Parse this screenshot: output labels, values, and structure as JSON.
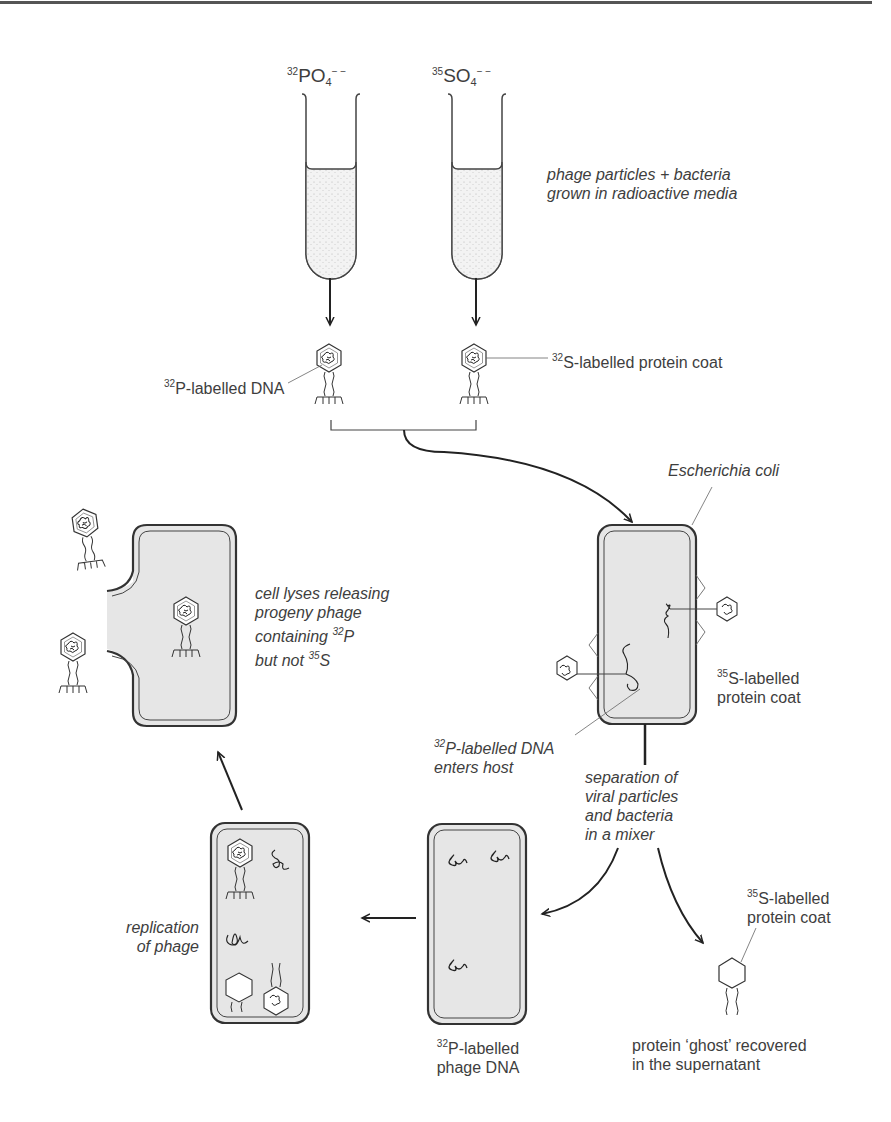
{
  "figure": {
    "tubes": [
      {
        "id": "tube-phosphate",
        "isotope": "32",
        "formula": "PO",
        "subscript": "4",
        "charge": "− −"
      },
      {
        "id": "tube-sulfate",
        "isotope": "35",
        "formula": "SO",
        "subscript": "4",
        "charge": "− −"
      }
    ],
    "labels": {
      "media": [
        "phage particles + bacteria",
        "grown in radioactive media"
      ],
      "p_dna": {
        "iso": "32",
        "text": "P-labelled DNA"
      },
      "s_coat_top": {
        "iso": "32",
        "text": "S-labelled protein coat"
      },
      "ecoli": "Escherichia coli",
      "s_coat_mid": {
        "iso": "35",
        "line1": "S-labelled",
        "line2": "protein coat"
      },
      "dna_enters": {
        "iso": "32",
        "line1": "P-labelled DNA",
        "line2": "enters host"
      },
      "separation": [
        "separation of",
        "viral particles",
        "and bacteria",
        "in a mixer"
      ],
      "s_coat_ghost": {
        "iso": "35",
        "line1": "S-labelled",
        "line2": "protein coat"
      },
      "ghost": [
        "protein ‘ghost’ recovered",
        "in the supernatant"
      ],
      "phage_dna": {
        "iso": "32",
        "line1": "P-labelled",
        "line2": "phage DNA"
      },
      "replication": [
        "replication",
        "of phage"
      ],
      "lysis": {
        "line1": "cell lyses releasing",
        "line2": "progeny phage",
        "line3_pre": "containing ",
        "line3_iso": "32",
        "line3_post": "P",
        "line4_pre": "but not ",
        "line4_iso": "35",
        "line4_post": "S"
      }
    },
    "colors": {
      "ink": "#333333",
      "text": "#3e3e3e",
      "cell_fill": "#e6e6e6",
      "media_fill": "#f1f1f1"
    }
  }
}
